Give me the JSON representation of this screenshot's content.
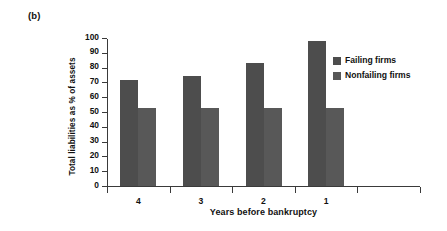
{
  "panel": {
    "label": "(b)"
  },
  "chart_data": {
    "type": "bar",
    "title": "",
    "subtitle": "",
    "xlabel": "Years before bankruptcy",
    "ylabel": "Total liabilities as % of assets",
    "categories": [
      "4",
      "3",
      "2",
      "1"
    ],
    "series": [
      {
        "name": "Failing firms",
        "color": "#4d4d4d",
        "values": [
          71.5,
          74,
          83,
          98
        ]
      },
      {
        "name": "Nonfailing firms",
        "color": "#585858",
        "values": [
          53,
          53,
          53,
          52.5
        ]
      }
    ],
    "ylim": [
      0,
      100
    ],
    "ytick_step": 10,
    "ytick_labels": [
      "100",
      "90",
      "80",
      "70",
      "60",
      "50",
      "40",
      "30",
      "20",
      "10",
      "0"
    ],
    "xtick_labels": [
      "4",
      "3",
      "2",
      "1"
    ],
    "grid": false,
    "legend_position": "right-top",
    "legend_entries": [
      "Failing firms",
      "Nonfailing firms"
    ]
  }
}
